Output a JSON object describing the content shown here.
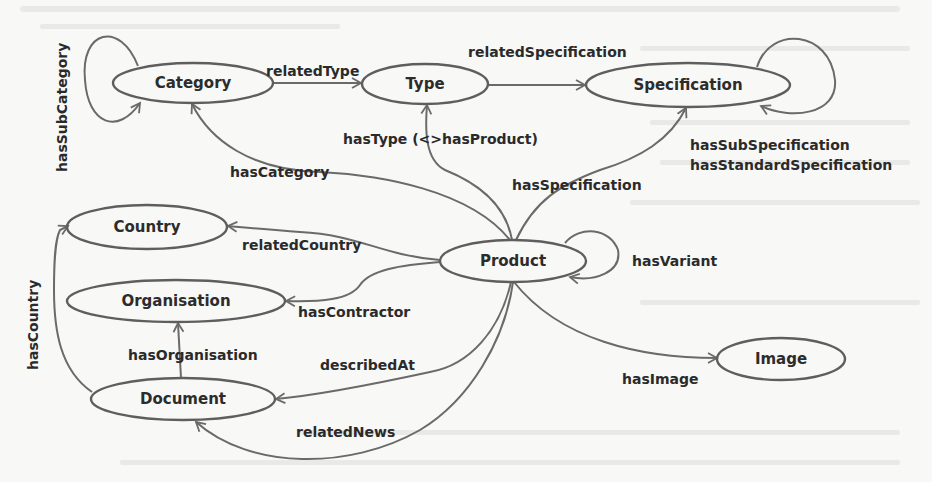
{
  "diagram": {
    "type": "ontology-graph",
    "nodes": [
      {
        "id": "category",
        "label": "Category",
        "cx": 193,
        "cy": 83,
        "rx": 80,
        "ry": 20
      },
      {
        "id": "type",
        "label": "Type",
        "cx": 425,
        "cy": 84,
        "rx": 63,
        "ry": 20
      },
      {
        "id": "specification",
        "label": "Specification",
        "cx": 688,
        "cy": 85,
        "rx": 102,
        "ry": 22
      },
      {
        "id": "country",
        "label": "Country",
        "cx": 147,
        "cy": 227,
        "rx": 80,
        "ry": 22
      },
      {
        "id": "product",
        "label": "Product",
        "cx": 513,
        "cy": 261,
        "rx": 73,
        "ry": 21
      },
      {
        "id": "organisation",
        "label": "Organisation",
        "cx": 176,
        "cy": 301,
        "rx": 109,
        "ry": 21
      },
      {
        "id": "image",
        "label": "Image",
        "cx": 781,
        "cy": 359,
        "rx": 64,
        "ry": 21
      },
      {
        "id": "document",
        "label": "Document",
        "cx": 183,
        "cy": 399,
        "rx": 92,
        "ry": 21
      }
    ],
    "edges": [
      {
        "id": "hasSubCategory",
        "label": "hasSubCategory",
        "from": "category",
        "to": "category"
      },
      {
        "id": "relatedType",
        "label": "relatedType",
        "from": "category",
        "to": "type"
      },
      {
        "id": "relatedSpecification",
        "label": "relatedSpecification",
        "from": "type",
        "to": "specification"
      },
      {
        "id": "hasSubSpecification",
        "label": "hasSubSpecification",
        "from": "specification",
        "to": "specification"
      },
      {
        "id": "hasStandardSpecification",
        "label": "hasStandardSpecification",
        "from": "specification",
        "to": "specification"
      },
      {
        "id": "hasType",
        "label": "hasType (<>hasProduct)",
        "from": "product",
        "to": "type"
      },
      {
        "id": "hasCategory",
        "label": "hasCategory",
        "from": "product",
        "to": "category"
      },
      {
        "id": "hasSpecification",
        "label": "hasSpecification",
        "from": "product",
        "to": "specification"
      },
      {
        "id": "relatedCountry",
        "label": "relatedCountry",
        "from": "product",
        "to": "country"
      },
      {
        "id": "hasVariant",
        "label": "hasVariant",
        "from": "product",
        "to": "product"
      },
      {
        "id": "hasContractor",
        "label": "hasContractor",
        "from": "product",
        "to": "organisation"
      },
      {
        "id": "hasOrganisation",
        "label": "hasOrganisation",
        "from": "document",
        "to": "organisation"
      },
      {
        "id": "describedAt",
        "label": "describedAt",
        "from": "product",
        "to": "document"
      },
      {
        "id": "hasImage",
        "label": "hasImage",
        "from": "product",
        "to": "image"
      },
      {
        "id": "relatedNews",
        "label": "relatedNews",
        "from": "product",
        "to": "document"
      },
      {
        "id": "hasCountry",
        "label": "hasCountry",
        "from": "document",
        "to": "country"
      }
    ]
  },
  "colors": {
    "background": "#f8f8f6",
    "stroke": "#5e5e5e",
    "text": "#2c2c2c"
  }
}
